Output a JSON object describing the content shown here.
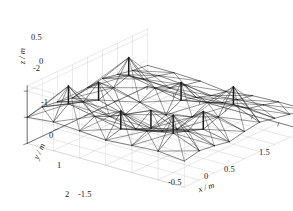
{
  "figure": {
    "background_color": "#ffffff",
    "mesh_color": "#1a1a1a",
    "grid_color": "#c8c8c8",
    "axis_color": "#4d4d4d",
    "text_color": "#1a1a1a"
  },
  "axes": {
    "x": {
      "title": "x / m",
      "symbol": "x",
      "unit": "m",
      "ticks": [
        "-1.5",
        "-0.5",
        "0",
        "0.5",
        "1.5"
      ],
      "tick_values": [
        -1.5,
        -0.5,
        0,
        0.5,
        1.5
      ],
      "range": [
        -1.5,
        1.5
      ]
    },
    "y": {
      "title": "y / m",
      "symbol": "y",
      "unit": "m",
      "ticks": [
        "-2",
        "-1",
        "0",
        "1",
        "2"
      ],
      "tick_values": [
        -2,
        -1,
        0,
        1,
        2
      ],
      "range": [
        -2,
        2
      ]
    },
    "z": {
      "title": "z / m",
      "symbol": "z",
      "unit": "m",
      "ticks": [
        "0.5",
        "0"
      ],
      "tick_values": [
        0.5,
        0
      ],
      "range": [
        -0.5,
        0.6
      ]
    }
  },
  "chart_data": {
    "type": "surface",
    "title": "",
    "xlabel": "x / m",
    "ylabel": "y / m",
    "zlabel": "z / m",
    "xlim": [
      -1.5,
      1.5
    ],
    "ylim": [
      -2,
      2
    ],
    "zlim": [
      -0.5,
      0.6
    ],
    "xticks": [
      -1.5,
      -0.5,
      0,
      0.5,
      1.5
    ],
    "yticks": [
      -2,
      -1,
      0,
      1,
      2
    ],
    "zticks": [
      0,
      0.5
    ],
    "grid": true,
    "legend": null,
    "view": {
      "azimuth": -37.5,
      "elevation": 22
    },
    "grid_nx": 7,
    "grid_ny": 9,
    "x": [
      -1.5,
      -1.0,
      -0.5,
      0.0,
      0.5,
      1.0,
      1.5
    ],
    "y": [
      -2.0,
      -1.5,
      -1.0,
      -0.5,
      0.0,
      0.5,
      1.0,
      1.5,
      2.0
    ],
    "z": [
      [
        0.0,
        0.05,
        0.02,
        -0.02,
        0.02,
        0.05,
        0.0
      ],
      [
        0.06,
        0.26,
        0.16,
        0.06,
        0.16,
        0.26,
        0.06
      ],
      [
        0.02,
        0.16,
        0.02,
        -0.08,
        0.02,
        0.16,
        0.02
      ],
      [
        -0.04,
        0.06,
        -0.08,
        -0.2,
        -0.08,
        0.06,
        -0.04
      ],
      [
        0.02,
        0.16,
        0.02,
        -0.08,
        0.02,
        0.16,
        0.02
      ],
      [
        0.06,
        0.26,
        0.16,
        0.06,
        0.16,
        0.26,
        0.06
      ],
      [
        0.0,
        0.05,
        0.02,
        -0.02,
        0.02,
        0.05,
        0.0
      ],
      [
        -0.06,
        -0.02,
        -0.06,
        -0.12,
        -0.06,
        -0.02,
        -0.06
      ],
      [
        -0.1,
        -0.1,
        -0.12,
        -0.18,
        -0.12,
        -0.1,
        -0.1
      ]
    ],
    "strut_height": 0.34,
    "strut_nodes": [
      [
        1,
        1
      ],
      [
        1,
        3
      ],
      [
        1,
        5
      ],
      [
        3,
        1
      ],
      [
        3,
        3
      ],
      [
        3,
        5
      ],
      [
        5,
        1
      ],
      [
        5,
        3
      ],
      [
        5,
        5
      ]
    ]
  }
}
